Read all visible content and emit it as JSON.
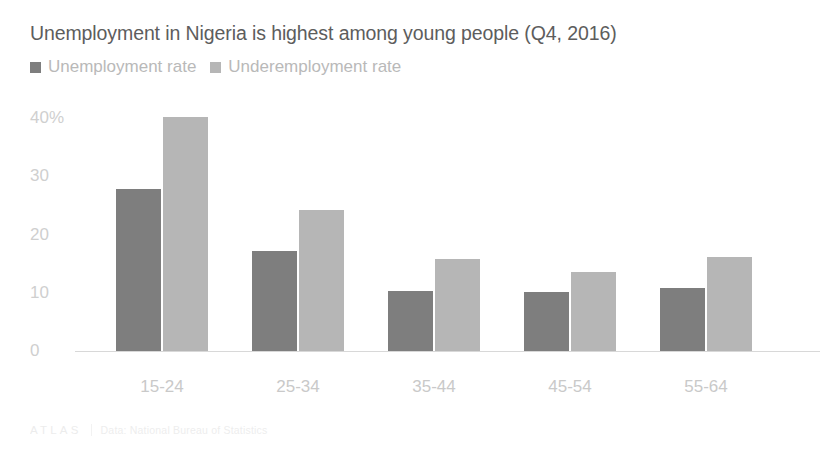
{
  "chart_data": {
    "type": "bar",
    "title": "Unemployment in Nigeria is highest among young people (Q4, 2016)",
    "xlabel": "",
    "ylabel": "",
    "categories": [
      "15-24",
      "25-34",
      "35-44",
      "45-54",
      "55-64"
    ],
    "series": [
      {
        "name": "Unemployment rate",
        "color": "#7e7e7e",
        "values": [
          25.8,
          15.9,
          9.6,
          9.4,
          10.1
        ]
      },
      {
        "name": "Underemployment rate",
        "color": "#b6b6b6",
        "values": [
          37.3,
          22.4,
          14.7,
          12.6,
          15.0
        ]
      }
    ],
    "ylim": [
      0,
      40
    ],
    "yticks": [
      0,
      10,
      20,
      30,
      40
    ],
    "ytick_labels": [
      "0",
      "10",
      "20",
      "30",
      "40%"
    ],
    "grid": false,
    "legend_position": "top-left"
  },
  "legend": {
    "items": [
      {
        "label": "Unemployment rate",
        "color": "#7e7e7e"
      },
      {
        "label": "Underemployment rate",
        "color": "#b6b6b6"
      }
    ]
  },
  "footer": {
    "logo": "ATLAS",
    "source": "Data: National Bureau of Statistics"
  }
}
